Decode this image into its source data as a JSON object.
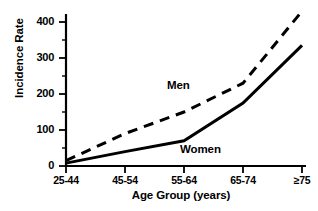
{
  "chart_data": {
    "type": "line",
    "title": "",
    "xlabel": "Age Group (years)",
    "ylabel": "Incidence Rate",
    "categories": [
      "25-44",
      "45-54",
      "55-64",
      "65-74",
      "≥75"
    ],
    "series": [
      {
        "name": "Men",
        "values": [
          15,
          90,
          150,
          230,
          430
        ],
        "style": "dashed"
      },
      {
        "name": "Women",
        "values": [
          8,
          40,
          70,
          175,
          335
        ],
        "style": "solid"
      }
    ],
    "ylim": [
      0,
      450
    ],
    "yticks": [
      0,
      100,
      200,
      300,
      400
    ],
    "ytick_labels": [
      "0",
      "100",
      "200",
      "300",
      "400"
    ],
    "minor_yticks": [
      50,
      150,
      250,
      350,
      450
    ],
    "grid": false,
    "legend": "inline-annotations",
    "line_color": "#000000"
  },
  "annotations": {
    "men_label": "Men",
    "women_label": "Women"
  }
}
